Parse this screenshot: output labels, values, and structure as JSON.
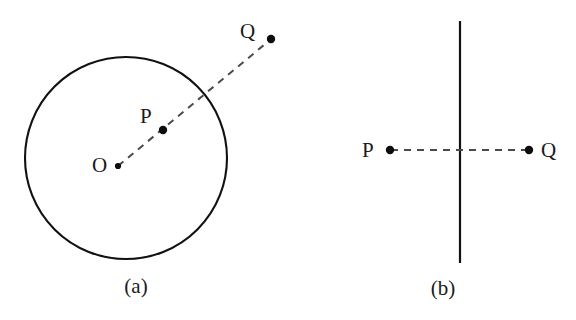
{
  "figure": {
    "background_color": "#ffffff",
    "ink_color": "#111111",
    "dash_color": "#4a4a4a",
    "width": 576,
    "height": 320,
    "panels": [
      {
        "id": "panel-a",
        "caption": "(a)",
        "caption_x": 136,
        "caption_y": 293,
        "shape": {
          "type": "circle",
          "cx": 126,
          "cy": 158,
          "r": 101,
          "stroke_width": 2.1
        },
        "ray": {
          "type": "dashed-segment",
          "x1": 118,
          "y1": 166,
          "x2": 270,
          "y2": 40,
          "dash": "7 6",
          "stroke_width": 2
        },
        "points": [
          {
            "name": "O",
            "label": "O",
            "dot_x": 118,
            "dot_y": 166,
            "dot_r": 3.1,
            "label_x": 92,
            "label_y": 172
          },
          {
            "name": "P",
            "label": "P",
            "dot_x": 163,
            "dot_y": 130,
            "dot_r": 4.2,
            "label_x": 140,
            "label_y": 123
          },
          {
            "name": "Q",
            "label": "Q",
            "dot_x": 271,
            "dot_y": 39,
            "dot_r": 4.2,
            "label_x": 240,
            "label_y": 38
          }
        ]
      },
      {
        "id": "panel-b",
        "caption": "(b)",
        "caption_x": 443,
        "caption_y": 295,
        "shape": {
          "type": "vertical-line",
          "x": 460,
          "y1": 21,
          "y2": 263,
          "stroke_width": 2.2
        },
        "ray": {
          "type": "dashed-segment",
          "x1": 391,
          "y1": 150,
          "x2": 528,
          "y2": 150,
          "dash": "7 6",
          "stroke_width": 2
        },
        "points": [
          {
            "name": "P",
            "label": "P",
            "dot_x": 390,
            "dot_y": 150,
            "dot_r": 4.2,
            "label_x": 362,
            "label_y": 157
          },
          {
            "name": "Q",
            "label": "Q",
            "dot_x": 529,
            "dot_y": 150,
            "dot_r": 4.2,
            "label_x": 541,
            "label_y": 157
          }
        ]
      }
    ]
  }
}
